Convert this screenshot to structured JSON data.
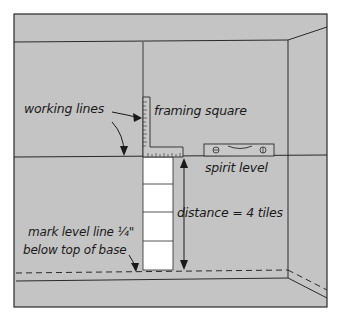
{
  "diagram": {
    "type": "wall-tile-layout-illustration",
    "colors": {
      "wall": "#c4c4c4",
      "line": "#2a2a2a",
      "tile": "#ffffff",
      "background": "#ffffff"
    },
    "labels": {
      "working_lines": "working lines",
      "framing_square": "framing square",
      "spirit_level": "spirit level",
      "distance": "distance = 4 tiles",
      "mark_line_1": "mark level line ¼\"",
      "mark_line_2": "below top of base"
    },
    "tile_count": 4
  }
}
